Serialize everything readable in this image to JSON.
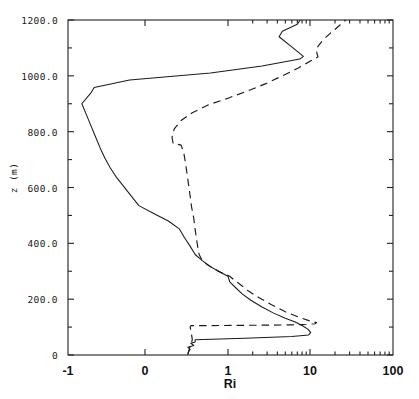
{
  "chart_data": {
    "type": "line",
    "title": "",
    "xlabel": "Ri",
    "ylabel": "z (m)",
    "xscale": "custom-log-with-negative",
    "xtick_labels": [
      "-1",
      "0",
      "1",
      "10",
      "100"
    ],
    "xtick_values": [
      -1,
      0,
      1,
      10,
      100
    ],
    "xtick_px": [
      68,
      145,
      228,
      310,
      393
    ],
    "ytick_labels": [
      "0",
      "200.0",
      "400.0",
      "600.0",
      "800.0",
      "1000.0",
      "1200.0"
    ],
    "ytick_values": [
      0,
      200,
      400,
      600,
      800,
      1000,
      1200
    ],
    "yminor_values": [
      100,
      300,
      500,
      700,
      900,
      1100
    ],
    "ylim": [
      0,
      1200
    ],
    "grid": false,
    "legend": "none",
    "frame": "box",
    "line_color": "#1a1a1a",
    "series": [
      {
        "name": "solid-profile",
        "style": "solid",
        "points": [
          [
            0.3,
            0
          ],
          [
            0.31,
            12
          ],
          [
            0.33,
            20
          ],
          [
            0.3,
            28
          ],
          [
            0.38,
            34
          ],
          [
            0.34,
            42
          ],
          [
            0.4,
            47
          ],
          [
            0.4,
            55
          ],
          [
            1.6,
            60
          ],
          [
            6.0,
            66
          ],
          [
            9.6,
            72
          ],
          [
            10.2,
            80
          ],
          [
            9.5,
            92
          ],
          [
            8.2,
            104
          ],
          [
            6.6,
            118
          ],
          [
            5.0,
            132
          ],
          [
            3.6,
            150
          ],
          [
            2.6,
            172
          ],
          [
            1.9,
            196
          ],
          [
            1.5,
            218
          ],
          [
            1.25,
            240
          ],
          [
            1.05,
            262
          ],
          [
            1.0,
            282
          ],
          [
            0.8,
            300
          ],
          [
            0.62,
            320
          ],
          [
            0.5,
            340
          ],
          [
            0.4,
            360
          ],
          [
            0.33,
            390
          ],
          [
            0.26,
            420
          ],
          [
            0.2,
            452
          ],
          [
            0.1,
            480
          ],
          [
            0.02,
            505
          ],
          [
            -0.08,
            535
          ],
          [
            -0.18,
            570
          ],
          [
            -0.28,
            605
          ],
          [
            -0.38,
            640
          ],
          [
            -0.45,
            670
          ],
          [
            -0.52,
            705
          ],
          [
            -0.58,
            740
          ],
          [
            -0.64,
            780
          ],
          [
            -0.7,
            820
          ],
          [
            -0.76,
            860
          ],
          [
            -0.82,
            900
          ],
          [
            -0.7,
            940
          ],
          [
            -0.66,
            958
          ],
          [
            -0.2,
            985
          ],
          [
            0.65,
            1010
          ],
          [
            2.6,
            1035
          ],
          [
            7.5,
            1060
          ],
          [
            8.3,
            1070
          ],
          [
            6.2,
            1100
          ],
          [
            4.2,
            1140
          ],
          [
            4.6,
            1160
          ],
          [
            7.0,
            1185
          ],
          [
            7.6,
            1200
          ]
        ]
      },
      {
        "name": "dashed-profile",
        "style": "dashed",
        "points": [
          [
            0.3,
            4
          ],
          [
            0.32,
            22
          ],
          [
            0.34,
            38
          ],
          [
            0.36,
            55
          ],
          [
            0.35,
            72
          ],
          [
            0.34,
            88
          ],
          [
            0.33,
            100
          ],
          [
            0.34,
            105
          ],
          [
            1.2,
            106
          ],
          [
            3.0,
            107
          ],
          [
            6.0,
            108
          ],
          [
            9.0,
            110
          ],
          [
            11.5,
            112
          ],
          [
            12.0,
            116
          ],
          [
            10.0,
            122
          ],
          [
            7.2,
            136
          ],
          [
            5.0,
            155
          ],
          [
            3.4,
            180
          ],
          [
            2.4,
            205
          ],
          [
            1.8,
            228
          ],
          [
            1.45,
            250
          ],
          [
            1.2,
            268
          ],
          [
            1.05,
            282
          ],
          [
            0.85,
            296
          ],
          [
            0.7,
            310
          ],
          [
            0.58,
            326
          ],
          [
            0.5,
            342
          ],
          [
            0.46,
            360
          ],
          [
            0.44,
            385
          ],
          [
            0.42,
            415
          ],
          [
            0.4,
            450
          ],
          [
            0.38,
            490
          ],
          [
            0.35,
            530
          ],
          [
            0.33,
            570
          ],
          [
            0.31,
            610
          ],
          [
            0.29,
            650
          ],
          [
            0.27,
            690
          ],
          [
            0.25,
            725
          ],
          [
            0.22,
            752
          ],
          [
            0.14,
            758
          ],
          [
            0.13,
            780
          ],
          [
            0.15,
            810
          ],
          [
            0.22,
            840
          ],
          [
            0.36,
            868
          ],
          [
            0.6,
            895
          ],
          [
            1.0,
            920
          ],
          [
            1.7,
            945
          ],
          [
            2.9,
            972
          ],
          [
            4.6,
            1000
          ],
          [
            7.2,
            1028
          ],
          [
            10.0,
            1052
          ],
          [
            12.5,
            1068
          ],
          [
            12.2,
            1078
          ],
          [
            11.8,
            1095
          ],
          [
            12.8,
            1110
          ],
          [
            14.5,
            1130
          ],
          [
            18.0,
            1155
          ],
          [
            23.0,
            1182
          ],
          [
            27.0,
            1200
          ]
        ]
      }
    ]
  }
}
